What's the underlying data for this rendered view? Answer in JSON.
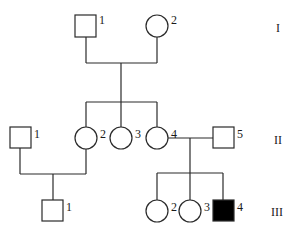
{
  "diagram": {
    "type": "pedigree",
    "generations": [
      {
        "label": "I",
        "individuals": [
          {
            "id": "I-1",
            "number": "1",
            "sex": "male",
            "affected": false
          },
          {
            "id": "I-2",
            "number": "2",
            "sex": "female",
            "affected": false
          }
        ]
      },
      {
        "label": "II",
        "individuals": [
          {
            "id": "II-1",
            "number": "1",
            "sex": "male",
            "affected": false
          },
          {
            "id": "II-2",
            "number": "2",
            "sex": "female",
            "affected": false
          },
          {
            "id": "II-3",
            "number": "3",
            "sex": "female",
            "affected": false
          },
          {
            "id": "II-4",
            "number": "4",
            "sex": "female",
            "affected": false
          },
          {
            "id": "II-5",
            "number": "5",
            "sex": "male",
            "affected": false
          }
        ]
      },
      {
        "label": "III",
        "individuals": [
          {
            "id": "III-1",
            "number": "1",
            "sex": "male",
            "affected": false
          },
          {
            "id": "III-2",
            "number": "2",
            "sex": "female",
            "affected": false
          },
          {
            "id": "III-3",
            "number": "3",
            "sex": "female",
            "affected": false
          },
          {
            "id": "III-4",
            "number": "4",
            "sex": "male",
            "affected": true
          }
        ]
      }
    ],
    "matings": [
      {
        "partners": [
          "I-1",
          "I-2"
        ],
        "children": [
          "II-2",
          "II-3",
          "II-4"
        ]
      },
      {
        "partners": [
          "II-1",
          "II-2"
        ],
        "children": [
          "III-1"
        ]
      },
      {
        "partners": [
          "II-4",
          "II-5"
        ],
        "children": [
          "III-2",
          "III-3",
          "III-4"
        ]
      }
    ],
    "colors": {
      "line": "#2a2a2a",
      "affected_fill": "#000000",
      "unaffected_fill": "#ffffff"
    }
  }
}
